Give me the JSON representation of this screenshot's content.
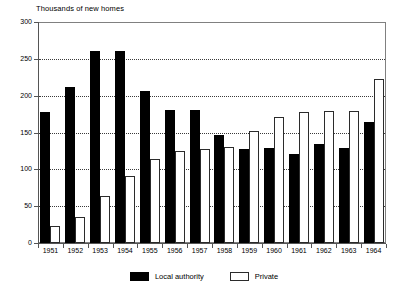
{
  "chart_data": {
    "type": "bar",
    "title": "Thousands of new homes",
    "xlabel": "",
    "ylabel": "",
    "ylim": [
      0,
      300
    ],
    "ytick_step": 50,
    "yticks": [
      300,
      250,
      200,
      150,
      100,
      50,
      0
    ],
    "grid": "horizontal-dotted",
    "legend_position": "bottom-center",
    "categories": [
      "1951",
      "1952",
      "1953",
      "1954",
      "1955",
      "1956",
      "1957",
      "1958",
      "1959",
      "1960",
      "1961",
      "1962",
      "1963",
      "1964"
    ],
    "series": [
      {
        "name": "Local authority",
        "color": "#000000",
        "style": "filled",
        "values": [
          178,
          212,
          261,
          261,
          206,
          181,
          180,
          147,
          128,
          129,
          121,
          134,
          129,
          164
        ]
      },
      {
        "name": "Private",
        "color": "#ffffff",
        "style": "outlined",
        "values": [
          23,
          35,
          64,
          91,
          114,
          125,
          127,
          131,
          152,
          171,
          178,
          179,
          179,
          222
        ]
      }
    ]
  },
  "axes": {
    "y_ticks": [
      "300",
      "250",
      "200",
      "150",
      "100",
      "50",
      "0"
    ],
    "x_ticks": [
      "1951",
      "1952",
      "1953",
      "1954",
      "1955",
      "1956",
      "1957",
      "1958",
      "1959",
      "1960",
      "1961",
      "1962",
      "1963",
      "1964"
    ]
  },
  "legend": {
    "items": [
      {
        "label": "Local authority",
        "swatch": "filled-black-square"
      },
      {
        "label": "Private",
        "swatch": "outlined-white-square"
      }
    ]
  }
}
